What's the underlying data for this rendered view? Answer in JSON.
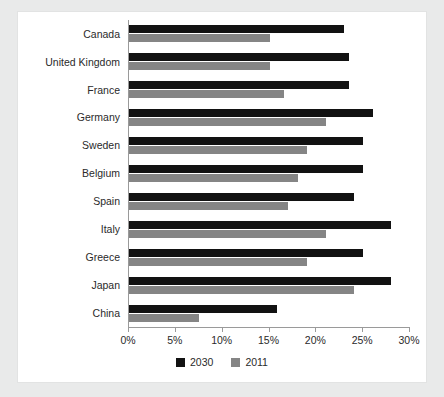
{
  "chart_data": {
    "type": "bar",
    "orientation": "horizontal",
    "title": "",
    "subtitle": "",
    "xlabel": "",
    "ylabel": "",
    "xlim": [
      0,
      30
    ],
    "xticks": [
      0,
      5,
      10,
      15,
      20,
      25,
      30
    ],
    "xtick_labels": [
      "0%",
      "5%",
      "10%",
      "15%",
      "20%",
      "25%",
      "30%"
    ],
    "grid": false,
    "legend_position": "bottom",
    "categories": [
      "Canada",
      "United Kingdom",
      "France",
      "Germany",
      "Sweden",
      "Belgium",
      "Spain",
      "Italy",
      "Greece",
      "Japan",
      "China"
    ],
    "series": [
      {
        "name": "2030",
        "color": "#121212",
        "values": [
          23,
          23.5,
          23.5,
          26,
          25,
          25,
          24,
          28,
          25,
          28,
          15.8
        ]
      },
      {
        "name": "2011",
        "color": "#858585",
        "values": [
          15,
          15,
          16.5,
          21,
          19,
          18,
          17,
          21,
          19,
          24,
          7.5
        ]
      }
    ]
  },
  "legend": {
    "items": [
      {
        "label": "2030",
        "swatch": "black-square-swatch"
      },
      {
        "label": "2011",
        "swatch": "gray-square-swatch"
      }
    ]
  },
  "colors": {
    "series_2030": "#121212",
    "series_2011": "#858585",
    "axis": "#9a9a9a",
    "card_background": "#ffffff",
    "page_background": "#e9eaea",
    "text": "#2a2a2a"
  }
}
